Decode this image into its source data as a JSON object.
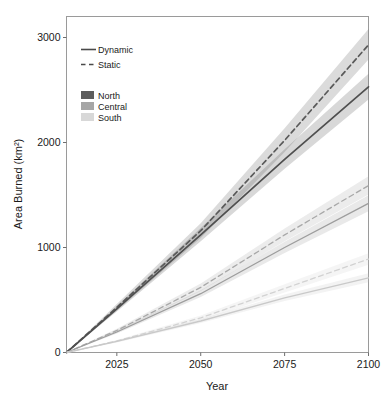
{
  "chart_data": {
    "type": "line",
    "title": "",
    "xlabel": "Year",
    "ylabel": "Area Burned (km²)",
    "xlim": [
      2010,
      2100
    ],
    "ylim": [
      0,
      3200
    ],
    "xticks": [
      2025,
      2050,
      2075,
      2100
    ],
    "xtick_labels": [
      "2025",
      "2050",
      "2075",
      "2100"
    ],
    "yticks": [
      0,
      1000,
      2000,
      3000
    ],
    "ytick_labels": [
      "0",
      "1000",
      "2000",
      "3000"
    ],
    "grid": false,
    "legend_position": "upper-left",
    "x": [
      2010,
      2025,
      2050,
      2075,
      2100
    ],
    "series": [
      {
        "name": "North Static",
        "region": "North",
        "scenario": "Static",
        "style": "dashed",
        "color": "#5a5a5a",
        "values": [
          0,
          430,
          1160,
          2020,
          2930
        ],
        "band_low": [
          0,
          400,
          1090,
          1910,
          2790
        ],
        "band_high": [
          0,
          462,
          1232,
          2135,
          3080
        ]
      },
      {
        "name": "North Dynamic",
        "region": "North",
        "scenario": "Dynamic",
        "style": "solid",
        "color": "#4f4f4f",
        "values": [
          0,
          415,
          1120,
          1840,
          2530
        ],
        "band_low": [
          0,
          390,
          1060,
          1750,
          2410
        ],
        "band_high": [
          0,
          442,
          1185,
          1935,
          2655
        ]
      },
      {
        "name": "Central Static",
        "region": "Central",
        "scenario": "Static",
        "style": "dashed",
        "color": "#a8a8a8",
        "values": [
          0,
          210,
          620,
          1120,
          1590
        ],
        "band_low": [
          0,
          195,
          585,
          1060,
          1505
        ],
        "band_high": [
          0,
          226,
          658,
          1182,
          1678
        ]
      },
      {
        "name": "Central Dynamic",
        "region": "Central",
        "scenario": "Dynamic",
        "style": "solid",
        "color": "#9d9d9d",
        "values": [
          0,
          195,
          560,
          1000,
          1420
        ],
        "band_low": [
          0,
          182,
          528,
          948,
          1345
        ],
        "band_high": [
          0,
          209,
          594,
          1055,
          1498
        ]
      },
      {
        "name": "South Static",
        "region": "South",
        "scenario": "Static",
        "style": "dashed",
        "color": "#d2d2d2",
        "values": [
          0,
          110,
          330,
          610,
          890
        ],
        "band_low": [
          0,
          100,
          308,
          572,
          836
        ],
        "band_high": [
          0,
          120,
          353,
          650,
          946
        ]
      },
      {
        "name": "South Dynamic",
        "region": "South",
        "scenario": "Dynamic",
        "style": "solid",
        "color": "#c9c9c9",
        "values": [
          0,
          105,
          300,
          520,
          710
        ],
        "band_low": [
          0,
          96,
          282,
          490,
          668
        ],
        "band_high": [
          0,
          114,
          320,
          552,
          754
        ]
      }
    ]
  },
  "legend": {
    "style_entries": [
      {
        "label": "Dynamic",
        "style": "solid"
      },
      {
        "label": "Static",
        "style": "dashed"
      }
    ],
    "region_entries": [
      {
        "label": "North",
        "color": "#5d5d5d"
      },
      {
        "label": "Central",
        "color": "#a6a6a6"
      },
      {
        "label": "South",
        "color": "#d8d8d8"
      }
    ]
  }
}
